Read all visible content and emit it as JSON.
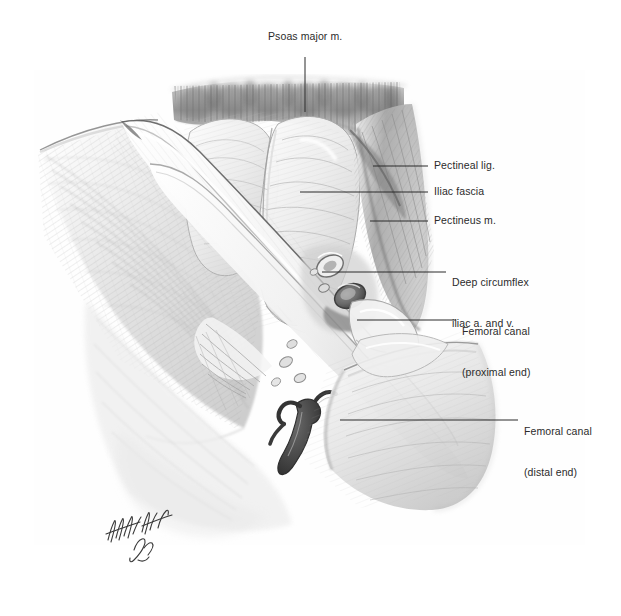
{
  "figure": {
    "background_color": "#fefefe",
    "ink_color": "#2b2b2b",
    "width": 621,
    "height": 616,
    "signature": {
      "name": "artist-signature",
      "text": "",
      "x": 104,
      "y": 515
    }
  },
  "annotations": [
    {
      "id": "psoas-major",
      "label": "Psoas major m.",
      "lines": [
        "Psoas major m."
      ],
      "text_x": 268,
      "text_y": 36,
      "align": "left",
      "leader": {
        "type": "vertical",
        "x1": 305,
        "y1": 57,
        "x2": 305,
        "y2": 112
      }
    },
    {
      "id": "pectineal-ligament",
      "label": "Pectineal lig.",
      "lines": [
        "Pectineal lig."
      ],
      "text_x": 434,
      "text_y": 160,
      "align": "left",
      "leader": {
        "type": "horizontal",
        "x1": 373,
        "y1": 166,
        "x2": 428,
        "y2": 166
      }
    },
    {
      "id": "iliac-fascia",
      "label": "Iliac fascia",
      "lines": [
        "Iliac fascia"
      ],
      "text_x": 434,
      "text_y": 186,
      "align": "left",
      "leader": {
        "type": "horizontal",
        "x1": 300,
        "y1": 192,
        "x2": 428,
        "y2": 192
      }
    },
    {
      "id": "pectineus-muscle",
      "label": "Pectineus m.",
      "lines": [
        "Pectineus m."
      ],
      "text_x": 434,
      "text_y": 215,
      "align": "left",
      "leader": {
        "type": "horizontal",
        "x1": 370,
        "y1": 221,
        "x2": 428,
        "y2": 221
      }
    },
    {
      "id": "deep-circumflex-iliac-vessels",
      "label": "Deep circumflex iliac a. and v.",
      "lines": [
        "Deep circumflex",
        "iliac a. and v."
      ],
      "text_x": 452,
      "text_y": 250,
      "align": "left",
      "leader": {
        "type": "horizontal",
        "x1": 322,
        "y1": 272,
        "x2": 446,
        "y2": 272
      }
    },
    {
      "id": "femoral-canal-proximal",
      "label": "Femoral canal (proximal end)",
      "lines": [
        "Femoral canal",
        "(proximal end)"
      ],
      "text_x": 462,
      "text_y": 299,
      "align": "left",
      "leader": {
        "type": "horizontal",
        "x1": 357,
        "y1": 320,
        "x2": 456,
        "y2": 320
      }
    },
    {
      "id": "femoral-canal-distal",
      "label": "Femoral canal (distal end)",
      "lines": [
        "Femoral canal",
        "(distal end)"
      ],
      "text_x": 524,
      "text_y": 399,
      "align": "left",
      "leader": {
        "type": "horizontal",
        "x1": 340,
        "y1": 420,
        "x2": 518,
        "y2": 420
      }
    }
  ],
  "structures": [
    {
      "id": "psoas-major-muscle",
      "name": "psoas-major-muscle",
      "description": "Dark striated muscle band across upper field"
    },
    {
      "id": "iliacus-fascia-lobes",
      "name": "iliac-fascia-lobes",
      "description": "Pale rounded fascia-covered lobes in centre"
    },
    {
      "id": "pectineus-muscle-body",
      "name": "pectineus-muscle",
      "description": "Striated muscle on right of field"
    },
    {
      "id": "pectineal-ligament-band",
      "name": "pectineal-ligament",
      "description": "Thin dense band superior to pectineus"
    },
    {
      "id": "inguinal-ligament-band",
      "name": "inguinal-ligament",
      "description": "Long pale diagonal band crossing field from upper-left to lower-right"
    },
    {
      "id": "external-oblique-aponeurosis",
      "name": "external-oblique-aponeurosis",
      "description": "Fan of fibres filling the left field"
    },
    {
      "id": "femoral-vessels-sheath",
      "name": "femoral-vessel-sheath",
      "description": "Pale tubular sheath descending to lower right"
    },
    {
      "id": "cut-vessel-lumens",
      "name": "cut-vessel-lumens",
      "description": "Two cut vessel cross-sections near deep circumflex iliac label"
    },
    {
      "id": "lymph-nodes",
      "name": "lymph-nodes",
      "description": "Small ovoid nodes near mid-field"
    },
    {
      "id": "superficial-vein-branch",
      "name": "superficial-vein-branch",
      "description": "Dark branching vein in lower-central field"
    },
    {
      "id": "sartorius-fibres",
      "name": "sartorius-muscle",
      "description": "Fibre bundle in lower-left of field"
    }
  ]
}
